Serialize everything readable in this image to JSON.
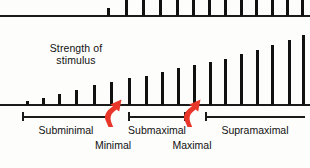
{
  "figure": {
    "axis_label_line1": "Strength of",
    "axis_label_line2": "stimulus",
    "arrow_color": "#E8372A",
    "bar_color": "#111111",
    "axis_color": "#1a1a1a"
  },
  "ranges": [
    {
      "label": "Subminimal",
      "x": 22,
      "width": 88
    },
    {
      "label": "Submaximal",
      "x": 128,
      "width": 58
    },
    {
      "label": "Supramaximal",
      "x": 205,
      "width": 100
    }
  ],
  "thresholds": [
    {
      "label": "Minimal",
      "x": 113
    },
    {
      "label": "Maximal",
      "x": 192
    }
  ],
  "chart_data": {
    "type": "bar",
    "title": "",
    "xlabel": "",
    "ylabel": "Strength of stimulus",
    "grid": false,
    "legend": null,
    "categories": [
      "1",
      "2",
      "3",
      "4",
      "5",
      "6",
      "7",
      "8",
      "9",
      "10",
      "11",
      "12",
      "13",
      "14",
      "15",
      "16",
      "17",
      "18"
    ],
    "values": [
      4,
      8,
      12,
      17,
      22,
      26,
      30,
      33,
      37,
      41,
      45,
      48,
      52,
      57,
      62,
      67,
      73,
      78
    ],
    "ylim": [
      0,
      85
    ],
    "bar_x": [
      26,
      42,
      58,
      75,
      93,
      110,
      128,
      145,
      161,
      177,
      193,
      209,
      224,
      240,
      256,
      271,
      288,
      302
    ],
    "bar_width": 3.2,
    "annotations": [
      {
        "text": "Subminimal",
        "kind": "range",
        "from": 22,
        "to": 110
      },
      {
        "text": "Submaximal",
        "kind": "range",
        "from": 128,
        "to": 186
      },
      {
        "text": "Supramaximal",
        "kind": "range",
        "from": 205,
        "to": 305
      },
      {
        "text": "Minimal",
        "kind": "threshold",
        "at": 113
      },
      {
        "text": "Maximal",
        "kind": "threshold",
        "at": 192
      }
    ]
  },
  "top_chart_data": {
    "type": "bar",
    "note": "cropped chart fragment above main figure",
    "values": [
      8,
      16,
      16,
      16,
      16,
      16,
      16,
      16,
      16,
      16,
      16,
      16,
      16
    ],
    "bar_x": [
      107,
      125,
      142,
      159,
      176,
      192,
      208,
      224,
      240,
      255,
      271,
      286,
      301
    ],
    "bar_width": 3.4,
    "ylim": [
      0,
      18
    ]
  }
}
